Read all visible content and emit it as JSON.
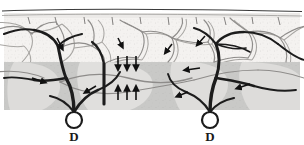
{
  "figure": {
    "width": 304,
    "height": 145,
    "background_color": "#ffffff"
  },
  "layers": [
    {
      "name": "surface-line",
      "label": "epidermal surface",
      "y_top": 10,
      "y_bottom": 13,
      "color": "#3a3a3a"
    },
    {
      "name": "stratum-band",
      "label": "upper stratum band",
      "y_top": 13,
      "y_bottom": 21,
      "color": "#efeeec"
    },
    {
      "name": "papillary-layer",
      "label": "papillary layer",
      "y_top": 21,
      "y_bottom": 62,
      "color": "#f3f1ef"
    },
    {
      "name": "reticular-layer",
      "label": "reticular layer",
      "y_top": 62,
      "y_bottom": 110,
      "color": "#c9c9c7"
    },
    {
      "name": "subcutis",
      "label": "subcutis",
      "y_top": 110,
      "y_bottom": 145,
      "color": "#ffffff"
    }
  ],
  "annotations": {
    "labels": [
      {
        "id": "label-d-left",
        "text": "D",
        "x": 74,
        "y": 141
      },
      {
        "id": "label-d-right",
        "text": "D",
        "x": 210,
        "y": 141
      }
    ],
    "nodes": [
      {
        "id": "node-d-left",
        "shape": "circle",
        "cx": 74,
        "cy": 120,
        "r": 8
      },
      {
        "id": "node-d-right",
        "shape": "circle",
        "cx": 210,
        "cy": 120,
        "r": 8
      }
    ],
    "arrow_groups": [
      {
        "id": "arrows-downward",
        "direction": "down",
        "count": 3,
        "x_positions": [
          118,
          127,
          136
        ],
        "y_top": 56,
        "y_bottom": 70,
        "color": "#111111"
      },
      {
        "id": "arrows-upward",
        "direction": "up",
        "count": 3,
        "x_positions": [
          118,
          127,
          136
        ],
        "y_top": 86,
        "y_bottom": 100,
        "color": "#111111"
      }
    ]
  },
  "vessels": {
    "trunk_color": "#1c1c1c",
    "capillary_color": "#8c8c8c",
    "flow_arrow_color": "#111111",
    "trunk_count": 4,
    "flow_arrow_count": 7
  },
  "colors": {
    "ink": "#1c1c1c",
    "capillary": "#8c8c8c",
    "papillary_fill": "#f3f1ef",
    "reticular_fill": "#c9c9c7",
    "lobule_fill": "#dedddb",
    "outline": "#9a9a98"
  }
}
